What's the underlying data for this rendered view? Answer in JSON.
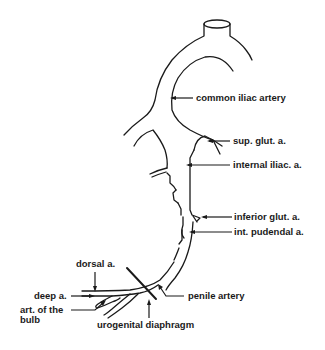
{
  "diagram": {
    "type": "anatomical-vascular-diagram",
    "labels": {
      "common_iliac": "common iliac artery",
      "sup_glut": "sup. glut. a.",
      "internal_iliac": "internal iliac. a.",
      "inferior_glut": "inferior glut. a.",
      "int_pudendal": "int. pudendal a.",
      "dorsal": "dorsal a.",
      "deep": "deep a.",
      "art_bulb_line1": "art. of the",
      "art_bulb_line2": "bulb",
      "penile": "penile artery",
      "urogenital": "urogenital diaphragm"
    },
    "colors": {
      "line": "#1a1a1a",
      "background": "#ffffff"
    }
  }
}
